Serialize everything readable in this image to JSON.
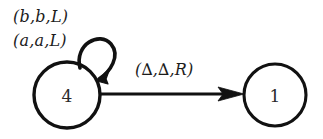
{
  "diagram": {
    "type": "turing-machine-state-diagram",
    "background_color": "#ffffff",
    "stroke_color": "#111111",
    "text_color": "#1c1c1c",
    "states": [
      {
        "id": "state-4",
        "label": "4",
        "cx": 67,
        "cy": 95,
        "r": 33
      },
      {
        "id": "state-1",
        "label": "1",
        "cx": 275,
        "cy": 95,
        "r": 31
      }
    ],
    "transitions": [
      {
        "id": "self-loop-4",
        "from": "state-4",
        "to": "state-4",
        "kind": "self-loop",
        "labels": [
          "(b,b,L)",
          "(a,a,L)"
        ]
      },
      {
        "id": "edge-4-to-1",
        "from": "state-4",
        "to": "state-1",
        "kind": "straight-arrow",
        "labels": [
          "(∆,∆,R)"
        ]
      }
    ]
  }
}
